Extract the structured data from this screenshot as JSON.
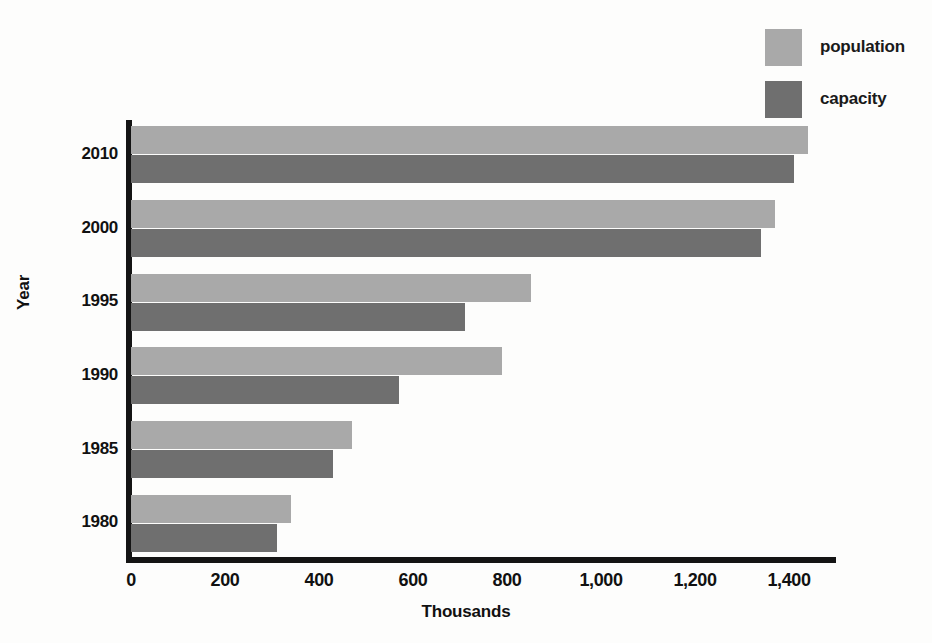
{
  "chart_data": {
    "type": "bar",
    "orientation": "horizontal",
    "title": "",
    "xlabel": "Thousands",
    "ylabel": "Year",
    "categories": [
      "1980",
      "1985",
      "1990",
      "1995",
      "2000",
      "2010"
    ],
    "series": [
      {
        "name": "population",
        "color": "#a9a9a9",
        "values": [
          340,
          470,
          790,
          850,
          1370,
          1440
        ]
      },
      {
        "name": "capacity",
        "color": "#6f6f6f",
        "values": [
          310,
          430,
          570,
          710,
          1340,
          1410
        ]
      }
    ],
    "xlim": [
      0,
      1500
    ],
    "xticks": [
      0,
      200,
      400,
      600,
      800,
      1000,
      1200,
      1400
    ],
    "xtick_labels": [
      "0",
      "200",
      "400",
      "600",
      "800",
      "1,000",
      "1,200",
      "1,400"
    ],
    "grid": false,
    "legend_position": "top-right",
    "legend_entries": [
      "population",
      "capacity"
    ]
  },
  "legend": {
    "items": [
      {
        "label": "population",
        "color": "#a9a9a9"
      },
      {
        "label": "capacity",
        "color": "#6f6f6f"
      }
    ]
  },
  "axes": {
    "x_title": "Thousands",
    "y_title": "Year",
    "y_tick_labels": [
      "2010",
      "2000",
      "1995",
      "1990",
      "1985",
      "1980"
    ],
    "x_tick_labels": [
      "0",
      "200",
      "400",
      "600",
      "800",
      "1,000",
      "1,200",
      "1,400"
    ]
  },
  "colors": {
    "population": "#a9a9a9",
    "capacity": "#6f6f6f",
    "axis": "#141414",
    "background": "#fdfdfc",
    "text": "#111111"
  }
}
